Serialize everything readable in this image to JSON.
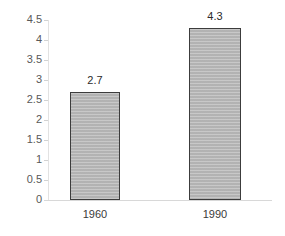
{
  "chart_data": {
    "type": "bar",
    "title": "",
    "subtitle": "",
    "xlabel": "",
    "ylabel": "",
    "categories": [
      "1960",
      "1990"
    ],
    "values": [
      2.7,
      4.3
    ],
    "value_labels": [
      "2.7",
      "4.3"
    ],
    "ylim": [
      0,
      4.5
    ],
    "ytick_values": [
      0,
      0.5,
      1,
      1.5,
      2,
      2.5,
      3,
      3.5,
      4,
      4.5
    ],
    "ytick_labels": [
      "0",
      "0.5",
      "1",
      "1.5",
      "2",
      "2.5",
      "3",
      "3.5",
      "4",
      "4.5"
    ],
    "grid": false,
    "legend": null,
    "legend_position": "none",
    "annotations": [],
    "series": [
      {
        "name": "",
        "values": [
          2.7,
          4.3
        ]
      }
    ],
    "colors": {
      "bar_fill": "#b9b9b9",
      "bar_border": "#3c3c3c",
      "background": "#ffffff",
      "axis_line": "#d8d8d8",
      "tick_text": "#595959",
      "label_text": "#2b2b2b",
      "category_text": "#3a3a3a"
    }
  }
}
